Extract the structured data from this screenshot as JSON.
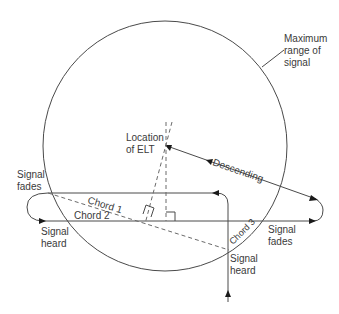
{
  "diagram": {
    "title": "",
    "labels": {
      "max_range": [
        "Maximum",
        "range of",
        "signal"
      ],
      "elt_location": [
        "Location",
        "of ELT"
      ],
      "descending": "Descending",
      "signal_fades_left": [
        "Signal",
        "fades"
      ],
      "signal_heard_left": [
        "Signal",
        "heard"
      ],
      "signal_fades_right": [
        "Signal",
        "fades"
      ],
      "signal_heard_bottom": [
        "Signal",
        "heard"
      ],
      "chord1": "Chord 1",
      "chord2": "Chord 2",
      "chord3": "Chord 3"
    },
    "colors": {
      "line": "#4a4a4a",
      "dashed": "#6a6a6a",
      "arrow": "#1a1a1a",
      "text": "#3a3a3a",
      "background": "#ffffff"
    }
  }
}
